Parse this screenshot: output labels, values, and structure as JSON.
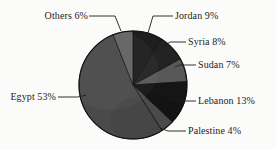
{
  "chart_data": {
    "type": "pie",
    "title": "",
    "categories": [
      "Jordan",
      "Syria",
      "Sudan",
      "Lebanon",
      "Palestine",
      "Egypt",
      "Others"
    ],
    "values": [
      9,
      8,
      7,
      13,
      4,
      53,
      6
    ],
    "value_unit": "%",
    "labels": [
      "Jordan 9%",
      "Syria 8%",
      "Sudan 7%",
      "Lebanon 13%",
      "Palestine 4%",
      "Egypt 53%",
      "Others 6%"
    ],
    "slice_colors": [
      "#1e1e1e",
      "#232323",
      "#585858",
      "#151515",
      "#4f4f4f",
      "#4a4a4a",
      "#636363"
    ],
    "start_angle_deg": 0,
    "direction": "clockwise",
    "legend": "none",
    "grid": false,
    "background_color": "#fbfbfa",
    "outline_color": "#111111",
    "leader_line_color": "#1c1c1c"
  },
  "labels": {
    "others": "Others 6%",
    "jordan": "Jordan 9%",
    "syria": "Syria 8%",
    "sudan": "Sudan 7%",
    "lebanon": "Lebanon 13%",
    "palestine": "Palestine 4%",
    "egypt": "Egypt 53%"
  }
}
